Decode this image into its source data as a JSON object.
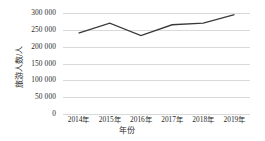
{
  "chart_data": {
    "type": "line",
    "title": "",
    "subtitle": "",
    "xlabel": "年份",
    "ylabel": "旅游人数/人",
    "categories": [
      "2014年",
      "2015年",
      "2016年",
      "2017年",
      "2018年",
      "2019年"
    ],
    "values": [
      240000,
      270000,
      233000,
      265000,
      270000,
      295000
    ],
    "series": [
      {
        "name": "旅游人数",
        "values": [
          240000,
          270000,
          233000,
          265000,
          270000,
          295000
        ]
      }
    ],
    "ylim": [
      0,
      300000
    ],
    "yticks": [
      0,
      50000,
      100000,
      150000,
      200000,
      250000,
      300000
    ],
    "ytick_labels": [
      "0",
      "50 000",
      "100 000",
      "150 000",
      "200 000",
      "250 000",
      "300 000"
    ],
    "grid": true,
    "grid_axis": "y",
    "legend": false,
    "legend_position": "none",
    "line_color": "#3a3a3a",
    "grid_color": "#d9d9d9",
    "background_color": "#ffffff",
    "markers": false
  }
}
